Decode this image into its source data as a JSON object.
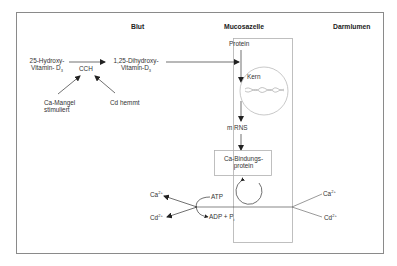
{
  "headers": {
    "blut": "Blut",
    "mucosazelle": "Mucosazelle",
    "darmlumen": "Darmlumen"
  },
  "left": {
    "hydroxy_line1": "25-Hydroxy-",
    "hydroxy_line2": "Vitamin- D",
    "hydroxy_sub": "3",
    "enzyme": "CCH",
    "dihydroxy_line1": "1,25-Dihydroxy-",
    "dihydroxy_line2": "Vitamin-D",
    "dihydroxy_sub": "3",
    "ca_mangel_line1": "Ca-Mangel",
    "ca_mangel_line2": "stimuliert",
    "cd_hemmt": "Cd hemmt"
  },
  "cell": {
    "protein": "Protein",
    "kern": "Kern",
    "mrns": "m RNS",
    "binding_line1": "Ca-Bindungs-",
    "binding_line2": "protein",
    "atp": "ATP",
    "adp": "ADP + P",
    "adp_sub": "i"
  },
  "ions": {
    "ca_left": "Ca",
    "cd_left": "Cd",
    "ca_right": "Ca",
    "cd_right": "Cd",
    "charge": "2+"
  },
  "colors": {
    "border": "#888888",
    "inner_border": "#aaaaaa",
    "arrow": "#333333"
  }
}
